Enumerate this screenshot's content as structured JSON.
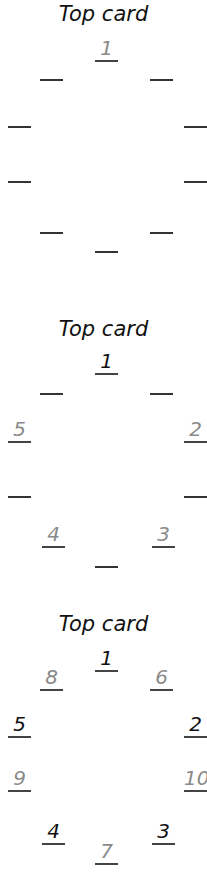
{
  "panels": [
    {
      "title": "Top card",
      "slots": {
        "top": {
          "label": "1",
          "color": "gray"
        },
        "upper_left": {
          "label": "",
          "color": "none"
        },
        "upper_right": {
          "label": "",
          "color": "none"
        },
        "left_upper": {
          "label": "",
          "color": "none"
        },
        "right_upper": {
          "label": "",
          "color": "none"
        },
        "left_lower": {
          "label": "",
          "color": "none"
        },
        "right_lower": {
          "label": "",
          "color": "none"
        },
        "lower_left": {
          "label": "",
          "color": "none"
        },
        "lower_right": {
          "label": "",
          "color": "none"
        },
        "bottom": {
          "label": "",
          "color": "none"
        }
      }
    },
    {
      "title": "Top card",
      "slots": {
        "top": {
          "label": "1",
          "color": "black"
        },
        "upper_left": {
          "label": "",
          "color": "none"
        },
        "upper_right": {
          "label": "",
          "color": "none"
        },
        "left_upper": {
          "label": "5",
          "color": "gray"
        },
        "right_upper": {
          "label": "2",
          "color": "gray"
        },
        "left_lower": {
          "label": "",
          "color": "none"
        },
        "right_lower": {
          "label": "",
          "color": "none"
        },
        "lower_left": {
          "label": "4",
          "color": "gray"
        },
        "lower_right": {
          "label": "3",
          "color": "gray"
        },
        "bottom": {
          "label": "",
          "color": "none"
        }
      }
    },
    {
      "title": "Top card",
      "slots": {
        "top": {
          "label": "1",
          "color": "black"
        },
        "upper_left": {
          "label": "8",
          "color": "gray"
        },
        "upper_right": {
          "label": "6",
          "color": "gray"
        },
        "left_upper": {
          "label": "5",
          "color": "black"
        },
        "right_upper": {
          "label": "2",
          "color": "black"
        },
        "left_lower": {
          "label": "9",
          "color": "gray"
        },
        "right_lower": {
          "label": "10",
          "color": "gray"
        },
        "lower_left": {
          "label": "4",
          "color": "black"
        },
        "lower_right": {
          "label": "3",
          "color": "black"
        },
        "bottom": {
          "label": "7",
          "color": "gray"
        }
      }
    }
  ],
  "colors": {
    "gray_label": "#8a8a8a",
    "black_label": "#111111",
    "line": "#444444"
  }
}
